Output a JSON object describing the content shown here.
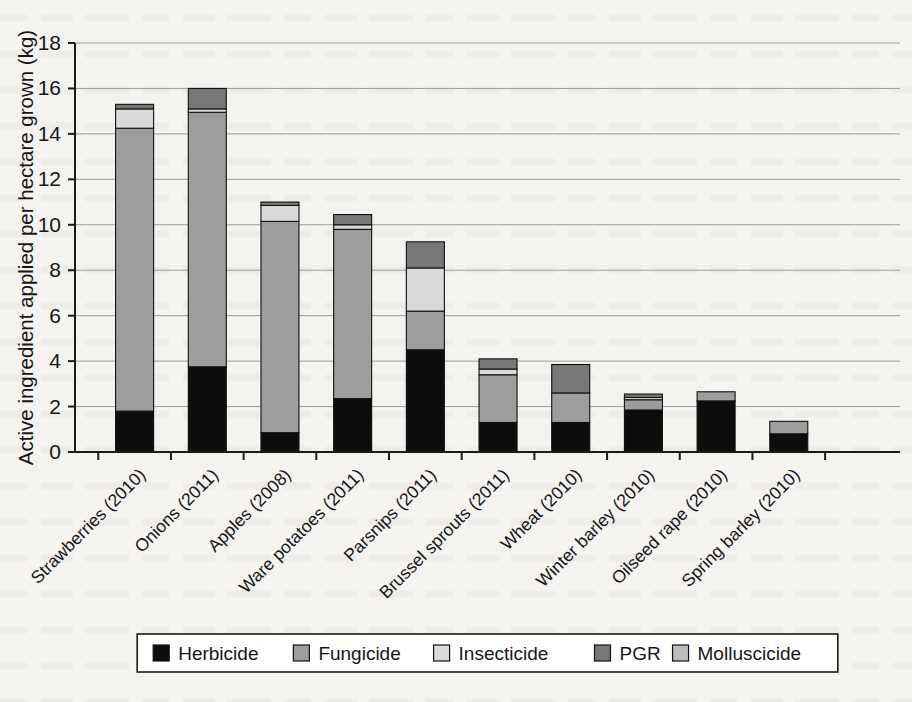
{
  "chart_data": {
    "type": "bar",
    "subtype": "stacked-vertical",
    "title": "",
    "xlabel": "",
    "ylabel": "Active ingredient applied per hectare grown (kg)",
    "ylim": [
      0,
      18
    ],
    "yticks": [
      0,
      2,
      4,
      6,
      8,
      10,
      12,
      14,
      16,
      18
    ],
    "ytick_labels": [
      "0",
      "2",
      "4",
      "6",
      "8",
      "10",
      "12",
      "14",
      "16",
      "18"
    ],
    "grid": "horizontal",
    "legend_position": "bottom",
    "categories": [
      "Strawberries (2010)",
      "Onions (2011)",
      "Apples (2008)",
      "Ware potatoes (2011)",
      "Parsnips (2011)",
      "Brussel sprouts (2011)",
      "Wheat (2010)",
      "Winter barley (2010)",
      "Oilseed rape (2010)",
      "Spring barley (2010)"
    ],
    "series": [
      {
        "name": "Herbicide",
        "color": "#0d0d0d",
        "values": [
          1.8,
          3.75,
          0.85,
          2.35,
          4.5,
          1.3,
          1.3,
          1.85,
          2.25,
          0.8
        ]
      },
      {
        "name": "Fungicide",
        "color": "#9d9d9d",
        "values": [
          12.45,
          11.2,
          9.3,
          7.45,
          1.7,
          2.1,
          1.3,
          0.45,
          0.4,
          0.55
        ]
      },
      {
        "name": "Insecticide",
        "color": "#d9d9d9",
        "values": [
          0.85,
          0.15,
          0.7,
          0.2,
          1.9,
          0.25,
          0.0,
          0.1,
          0.0,
          0.0
        ]
      },
      {
        "name": "PGR",
        "color": "#777777",
        "values": [
          0.2,
          0.9,
          0.15,
          0.45,
          1.15,
          0.45,
          1.25,
          0.15,
          0.0,
          0.0
        ]
      },
      {
        "name": "Molluscicide",
        "color": "#bdbdbd",
        "values": [
          0.0,
          0.0,
          0.0,
          0.0,
          0.0,
          0.0,
          0.0,
          0.0,
          0.0,
          0.0
        ]
      }
    ],
    "totals": [
      15.3,
      16.0,
      11.0,
      10.45,
      9.25,
      4.1,
      3.85,
      2.55,
      2.65,
      1.35
    ]
  },
  "legend": {
    "items": [
      {
        "label": "Herbicide",
        "swatch": "legend-swatch-herbicide"
      },
      {
        "label": "Fungicide",
        "swatch": "legend-swatch-fungicide"
      },
      {
        "label": "Insecticide",
        "swatch": "legend-swatch-insecticide"
      },
      {
        "label": "PGR",
        "swatch": "legend-swatch-pgr"
      },
      {
        "label": "Molluscicide",
        "swatch": "legend-swatch-molluscicide"
      }
    ]
  },
  "colors": {
    "herbicide": "#0d0d0d",
    "fungicide": "#9d9d9d",
    "insecticide": "#d9d9d9",
    "pgr": "#777777",
    "molluscicide": "#bdbdbd",
    "axis": "#1a1a1a",
    "grid": "#9b9b9b",
    "page_background": "#f4f3f0"
  }
}
